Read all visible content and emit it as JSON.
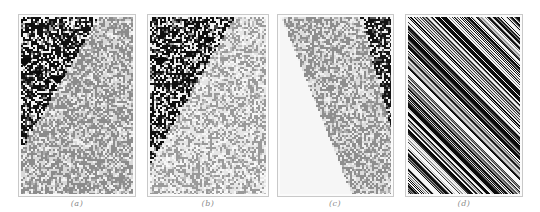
{
  "figure": {
    "panels": [
      {
        "id": "a",
        "caption": "(a)",
        "left": 18,
        "width": 118,
        "cell": 2,
        "description": "gray textured region upper-left, dense black/white chaotic region lower-right",
        "regions": [
          {
            "name": "gray",
            "colors": [
              "#8c8c8c",
              "#d8d8d8",
              "#f2f2f2",
              "#a8a8a8"
            ],
            "weights": [
              0.45,
              0.3,
              0.15,
              0.1
            ]
          },
          {
            "name": "dark",
            "colors": [
              "#111111",
              "#f4f4f4",
              "#444444",
              "#9a9a9a"
            ],
            "weights": [
              0.5,
              0.3,
              0.1,
              0.1
            ]
          }
        ],
        "boundary": [
          [
            0.68,
            0.0
          ],
          [
            0.0,
            0.74
          ]
        ]
      },
      {
        "id": "b",
        "caption": "(b)",
        "left": 147,
        "width": 122,
        "cell": 2,
        "description": "light maze-like textured region upper-left, dark chaotic region lower-right",
        "regions": [
          {
            "name": "light",
            "colors": [
              "#9a9a9a",
              "#e6e6e6",
              "#f7f7f7",
              "#bdbdbd"
            ],
            "weights": [
              0.35,
              0.35,
              0.2,
              0.1
            ]
          },
          {
            "name": "dark",
            "colors": [
              "#101010",
              "#f2f2f2",
              "#4a4a4a",
              "#a0a0a0"
            ],
            "weights": [
              0.5,
              0.3,
              0.1,
              0.1
            ]
          }
        ],
        "boundary": [
          [
            0.72,
            0.0
          ],
          [
            0.0,
            0.82
          ]
        ]
      },
      {
        "id": "c",
        "caption": "(c)",
        "left": 277,
        "width": 117,
        "cell": 2,
        "description": "blank white region left, gray chevron texture band middle, dark chaotic patch upper-right",
        "regions": [
          {
            "name": "blank",
            "colors": [
              "#f6f6f6"
            ],
            "weights": [
              1.0
            ]
          },
          {
            "name": "gray",
            "colors": [
              "#8e8e8e",
              "#dcdcdc",
              "#f0f0f0",
              "#b0b0b0"
            ],
            "weights": [
              0.45,
              0.3,
              0.15,
              0.1
            ]
          },
          {
            "name": "dark",
            "colors": [
              "#151515",
              "#ededed",
              "#5a5a5a"
            ],
            "weights": [
              0.55,
              0.3,
              0.15
            ]
          }
        ],
        "boundary": [
          [
            0.02,
            0.02
          ],
          [
            0.64,
            1.0
          ]
        ],
        "boundary2": [
          [
            0.72,
            0.0
          ],
          [
            1.0,
            0.64
          ]
        ]
      },
      {
        "id": "d",
        "caption": "(d)",
        "left": 405,
        "width": 118,
        "cell": 1,
        "description": "diagonal stripes of black, gray and white running from lower-left to upper-right",
        "regions": [
          {
            "name": "stripes",
            "colors": [
              "#0c0c0c",
              "#f5f5f5",
              "#8a8a8a",
              "#3a3a3a",
              "#c8c8c8"
            ],
            "weights": [
              0.3,
              0.3,
              0.15,
              0.15,
              0.1
            ]
          }
        ],
        "stripe_slope": 1.0
      }
    ]
  }
}
